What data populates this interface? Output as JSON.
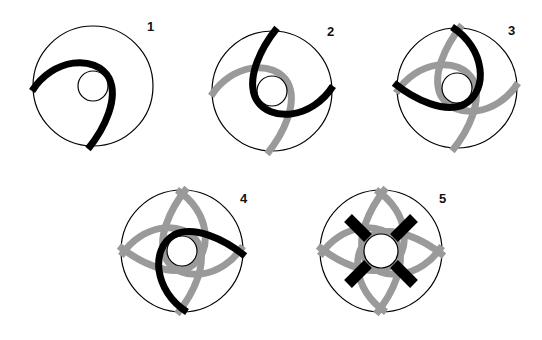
{
  "diagram": {
    "title": "",
    "colors": {
      "background": "#ffffff",
      "outline": "#000000",
      "active_stroke": "#000000",
      "previous_stroke": "#9a9a9a",
      "label": "#111111"
    },
    "panels": [
      {
        "label": "1",
        "step": 1,
        "active_arc_rotation": 0,
        "previous_arc_rotations": []
      },
      {
        "label": "2",
        "step": 2,
        "active_arc_rotation": 180,
        "previous_arc_rotations": [
          0
        ]
      },
      {
        "label": "3",
        "step": 3,
        "active_arc_rotation": 90,
        "previous_arc_rotations": [
          0,
          180
        ]
      },
      {
        "label": "4",
        "step": 4,
        "active_arc_rotation": 270,
        "previous_arc_rotations": [
          0,
          180,
          90
        ]
      },
      {
        "label": "5",
        "step": 5,
        "active_arc_rotation": null,
        "previous_arc_rotations": [
          0,
          180,
          90,
          270
        ],
        "final_marks": "four black diagonal bars around inner circle"
      }
    ]
  }
}
